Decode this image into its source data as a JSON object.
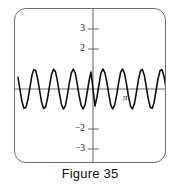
{
  "figure": {
    "caption": "Figure 35"
  },
  "chart_data": {
    "type": "line",
    "title": "",
    "subtitle": "",
    "xlabel": "",
    "ylabel": "",
    "grid": false,
    "legend": null,
    "function": "y = sin(6x)",
    "amplitude": 1,
    "cycles_visible": 6.5,
    "xlim": [
      -3.8,
      3.8
    ],
    "ylim": [
      -3.8,
      3.8
    ],
    "yticks": [
      3,
      2,
      -2,
      -3
    ],
    "ytick_labels": [
      "3",
      "2",
      "−2",
      "−3"
    ],
    "xticks": [],
    "xtick_labels": [],
    "annotations": [
      {
        "text": "π",
        "x": 3.14,
        "y": -0.45
      }
    ],
    "series": [
      {
        "name": "wave",
        "color": "#111111",
        "x": [
          -3.8,
          -3.7,
          -3.6,
          -3.5,
          -3.4,
          -3.3,
          -3.2,
          -3.1,
          -3.0,
          -2.9,
          -2.8,
          -2.7,
          -2.6,
          -2.5,
          -2.4,
          -2.3,
          -2.2,
          -2.1,
          -2.0,
          -1.9,
          -1.8,
          -1.7,
          -1.6,
          -1.5,
          -1.4,
          -1.3,
          -1.2,
          -1.1,
          -1.0,
          -0.9,
          -0.8,
          -0.7,
          -0.6,
          -0.5,
          -0.4,
          -0.3,
          -0.2,
          -0.1,
          0.0,
          0.1,
          0.2,
          0.3,
          0.4,
          0.5,
          0.6,
          0.7,
          0.8,
          0.9,
          1.0,
          1.1,
          1.2,
          1.3,
          1.4,
          1.5,
          1.6,
          1.7,
          1.8,
          1.9,
          2.0,
          2.1,
          2.2,
          2.3,
          2.4,
          2.5,
          2.6,
          2.7,
          2.8,
          2.9,
          3.0,
          3.1,
          3.2,
          3.3,
          3.4,
          3.5,
          3.6,
          3.7,
          3.8
        ],
        "y": [
          0.58,
          -0.03,
          -0.63,
          -0.96,
          -0.92,
          -0.54,
          0.05,
          0.66,
          0.97,
          0.91,
          0.49,
          -0.11,
          -0.69,
          -0.98,
          -0.89,
          -0.44,
          0.17,
          0.73,
          0.99,
          0.86,
          0.38,
          -0.23,
          -0.76,
          -1.0,
          -0.84,
          -0.32,
          0.29,
          0.79,
          1.0,
          0.81,
          0.26,
          -0.35,
          -0.82,
          -1.0,
          -0.78,
          -0.2,
          0.4,
          0.85,
          0.0,
          -0.85,
          -0.4,
          0.2,
          0.78,
          1.0,
          0.82,
          0.35,
          -0.26,
          -0.81,
          -1.0,
          -0.79,
          -0.29,
          0.32,
          0.84,
          1.0,
          0.76,
          0.23,
          -0.38,
          -0.86,
          -0.99,
          -0.73,
          -0.17,
          0.44,
          0.89,
          0.98,
          0.69,
          0.11,
          -0.49,
          -0.91,
          -0.97,
          -0.66,
          -0.05,
          0.54,
          0.92,
          0.96,
          0.63,
          0.03,
          -0.58
        ]
      }
    ]
  }
}
